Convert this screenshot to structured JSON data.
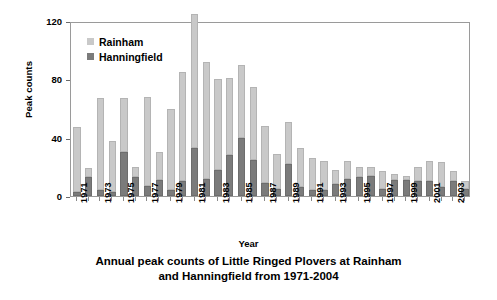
{
  "chart_data": {
    "type": "bar",
    "stacked": true,
    "title": "Annual peak counts of Little Ringed Plovers at Rainham and Hanningfield from 1971-2004",
    "title_line1": "Annual peak counts of Little Ringed Plovers at Rainham",
    "title_line2": "and Hanningfield from 1971-2004",
    "xlabel": "Year",
    "ylabel": "Peak counts",
    "ylim": [
      0,
      120
    ],
    "yticks": [
      0,
      40,
      80,
      120
    ],
    "ytick_labels": [
      "0",
      "40",
      "80",
      "120"
    ],
    "grid": false,
    "legend_position": "top-left",
    "categories": [
      "1971",
      "1972",
      "1973",
      "1974",
      "1975",
      "1976",
      "1977",
      "1978",
      "1979",
      "1980",
      "1981",
      "1982",
      "1983",
      "1984",
      "1985",
      "1986",
      "1987",
      "1988",
      "1989",
      "1990",
      "1991",
      "1992",
      "1993",
      "1994",
      "1995",
      "1996",
      "1997",
      "1998",
      "1999",
      "2000",
      "2001",
      "2002",
      "2003",
      "2004"
    ],
    "xtick_labels": [
      "1971",
      "",
      "1973",
      "",
      "1975",
      "",
      "1977",
      "",
      "1979",
      "",
      "1981",
      "",
      "1983",
      "",
      "1985",
      "",
      "1987",
      "",
      "1989",
      "",
      "1991",
      "",
      "1993",
      "",
      "1995",
      "",
      "1997",
      "",
      "1999",
      "",
      "2001",
      "",
      "2003",
      ""
    ],
    "series": [
      {
        "name": "Rainham",
        "color": "#c9c9c9",
        "values": [
          44,
          6,
          63,
          35,
          37,
          7,
          61,
          19,
          56,
          75,
          92,
          80,
          62,
          53,
          50,
          50,
          39,
          24,
          29,
          27,
          22,
          20,
          10,
          12,
          7,
          6,
          12,
          4,
          3,
          10,
          14,
          17,
          7,
          5
        ]
      },
      {
        "name": "Hanningfield",
        "color": "#7b7b7b",
        "values": [
          3,
          13,
          4,
          3,
          30,
          13,
          7,
          11,
          4,
          10,
          33,
          12,
          18,
          28,
          40,
          25,
          9,
          5,
          22,
          6,
          4,
          4,
          8,
          12,
          13,
          14,
          5,
          11,
          11,
          10,
          10,
          6,
          10,
          5
        ]
      }
    ],
    "totals": [
      47,
      19,
      67,
      38,
      67,
      20,
      68,
      30,
      60,
      85,
      125,
      92,
      80,
      81,
      90,
      75,
      48,
      29,
      51,
      33,
      26,
      24,
      18,
      24,
      20,
      20,
      17,
      15,
      14,
      20,
      24,
      23,
      17,
      10
    ]
  },
  "legend": {
    "items": [
      {
        "label": "Rainham"
      },
      {
        "label": "Hanningfield"
      }
    ]
  }
}
